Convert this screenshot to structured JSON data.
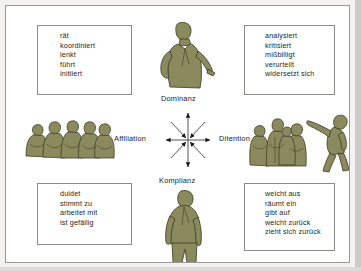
{
  "diagram": {
    "title_visible": false,
    "colors": {
      "figure_fill": "#8a8a5e",
      "figure_outline": "#3c3a22",
      "box_border": "#8d8b88",
      "panel_border": "#9a9894",
      "text": "#201f1d",
      "background": "#ffffff",
      "scan_background": "#f4f3f1"
    },
    "axes": {
      "vertical_top_label": "Dominanz",
      "vertical_bottom_label": "Komplianz",
      "horizontal_left_label": "Affiliation",
      "horizontal_right_label": "Ditention"
    },
    "boxes": {
      "dominanz": {
        "position": "top-left",
        "items": [
          "rät",
          "koordiniert",
          "lenkt",
          "führt",
          "initiiert"
        ]
      },
      "detention": {
        "position": "top-right",
        "items": [
          "analysiert",
          "kritisiert",
          "mißbilligt",
          "verurteilt",
          "widersetzt sich"
        ]
      },
      "komplianz": {
        "position": "bottom-left",
        "items": [
          "duldet",
          "stimmt zu",
          "arbeitet mit",
          "ist gefällig"
        ]
      },
      "weicht": {
        "position": "bottom-right",
        "items": [
          "weicht aus",
          "räumt ein",
          "gibt auf",
          "weicht zurück",
          "zieht sich zurück"
        ]
      }
    },
    "figures": {
      "dominanz": "man-hand-on-hip-pointing-figure",
      "komplianz": "man-slouching-figure",
      "affiliation": "group-of-five-people-figure",
      "ditention_group": "group-of-people-figure",
      "ditention_walker": "man-walking-away-arm-raised-figure"
    },
    "compass": {
      "name": "eight-pointed-arrow-star",
      "cardinal_direction": "outward",
      "diagonal_direction": "inward",
      "arrow_count": 8
    }
  }
}
